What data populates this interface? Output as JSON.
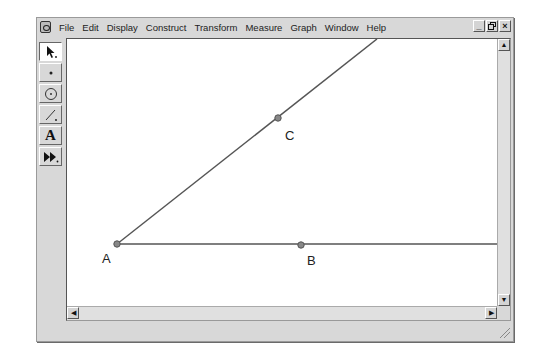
{
  "menubar": {
    "items": [
      "File",
      "Edit",
      "Display",
      "Construct",
      "Transform",
      "Measure",
      "Graph",
      "Window",
      "Help"
    ],
    "controls": {
      "minimize": "_",
      "restore": "ő",
      "close": "×"
    }
  },
  "toolbox": {
    "tools": [
      {
        "name": "selection-arrow-tool",
        "glyph": "↖"
      },
      {
        "name": "point-tool",
        "glyph": "•"
      },
      {
        "name": "compass-tool",
        "glyph": "⊙"
      },
      {
        "name": "straightedge-tool",
        "glyph": "∕"
      },
      {
        "name": "text-tool",
        "glyph": "A"
      },
      {
        "name": "custom-tool",
        "glyph": "⏩"
      }
    ]
  },
  "canvas": {
    "points": [
      {
        "label": "A",
        "x": 116,
        "y": 243
      },
      {
        "label": "B",
        "x": 300,
        "y": 244
      },
      {
        "label": "C",
        "x": 277,
        "y": 117
      }
    ],
    "rays": [
      {
        "from": "A",
        "through": "C"
      },
      {
        "from": "A",
        "through": "B"
      }
    ]
  },
  "scrollbars": {
    "up": "▲",
    "down": "▼",
    "left": "◀",
    "right": "▶"
  }
}
